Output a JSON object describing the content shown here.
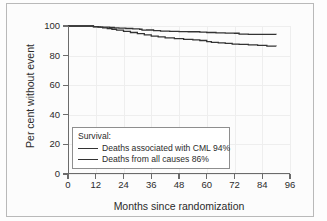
{
  "figure": {
    "background_color": "#fcfcfc",
    "frame_color": "#b9b9b9"
  },
  "chart_data": {
    "type": "line",
    "subtype": "kaplan-meier-step",
    "title": "",
    "xlabel": "Months since randomization",
    "ylabel": "Per cent without event",
    "xlim": [
      0,
      96
    ],
    "ylim": [
      0,
      100
    ],
    "xticks": [
      0,
      12,
      24,
      36,
      48,
      60,
      72,
      84,
      96
    ],
    "yticks": [
      0,
      20,
      40,
      60,
      80,
      100
    ],
    "grid": true,
    "legend_position": "lower-left-inside",
    "legend_title": "Survival:",
    "series": [
      {
        "name": "Deaths associated with CML 94%",
        "label_short": "Deaths associated with CML",
        "final_value_percent": 94,
        "color": "#333333",
        "x": [
          0,
          9,
          11,
          13,
          14,
          15,
          18,
          20,
          22,
          25,
          28,
          31,
          32,
          34,
          37,
          40,
          44,
          48,
          52,
          57,
          60,
          64,
          68,
          72,
          74,
          78,
          84,
          90
        ],
        "y": [
          100,
          100,
          99.6,
          99.4,
          99.2,
          99.2,
          99.0,
          98.8,
          98.6,
          98.3,
          98.0,
          97.8,
          97.2,
          97.3,
          96.9,
          96.6,
          96.4,
          96.2,
          96.1,
          95.8,
          95.6,
          95.4,
          95.2,
          95.1,
          94.5,
          94.4,
          94.3,
          94.2
        ]
      },
      {
        "name": "Deaths from all causes 86%",
        "label_short": "Deaths from all causes",
        "final_value_percent": 86,
        "color": "#333333",
        "x": [
          0,
          9,
          11,
          13,
          15,
          17,
          19,
          21,
          24,
          27,
          30,
          33,
          36,
          39,
          42,
          46,
          50,
          54,
          57,
          60,
          62,
          65,
          68,
          71,
          74,
          78,
          82,
          86,
          90
        ],
        "y": [
          100,
          100,
          99.5,
          99.2,
          98.8,
          98.3,
          97.8,
          97.2,
          96.4,
          95.6,
          94.8,
          94.0,
          93.2,
          92.6,
          92.0,
          91.5,
          91.0,
          90.6,
          90.2,
          89.4,
          89.0,
          88.6,
          88.2,
          87.8,
          87.6,
          87.2,
          86.9,
          86.4,
          86.3
        ]
      }
    ]
  },
  "legend": {
    "title": "Survival:",
    "entries": [
      {
        "label": "Deaths associated with CML 94%"
      },
      {
        "label": "Deaths from all causes 86%"
      }
    ]
  },
  "axes": {
    "y_title": "Per cent without event",
    "x_title": "Months since randomization",
    "y_ticks": [
      "0",
      "20",
      "40",
      "60",
      "80",
      "100"
    ],
    "x_ticks": [
      "0",
      "12",
      "24",
      "36",
      "48",
      "60",
      "72",
      "84",
      "96"
    ]
  }
}
